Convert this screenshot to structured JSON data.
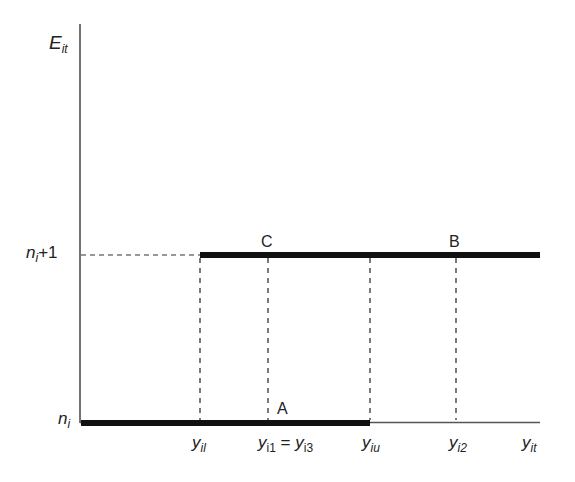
{
  "diagram": {
    "y_axis_label": {
      "main": "E",
      "sub": "it"
    },
    "x_axis_label": {
      "main": "y",
      "sub": "it"
    },
    "y_ticks": [
      {
        "main": "n",
        "sub": "i",
        "suffix": "+1"
      },
      {
        "main": "n",
        "sub": "i",
        "suffix": ""
      }
    ],
    "x_ticks": [
      {
        "id": "yil",
        "main": "y",
        "sub": "il"
      },
      {
        "id": "yi1",
        "main": "y",
        "sub": "i1",
        "eq": " = ",
        "main2": "y",
        "sub2": "i3"
      },
      {
        "id": "yiu",
        "main": "y",
        "sub": "iu"
      },
      {
        "id": "yi2",
        "main": "y",
        "sub": "i2"
      }
    ],
    "points": {
      "A": "A",
      "B": "B",
      "C": "C"
    },
    "colors": {
      "line": "#111111",
      "dash": "#333333",
      "axis": "#444444"
    }
  }
}
